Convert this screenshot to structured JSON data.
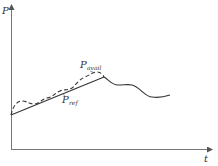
{
  "diagram": {
    "type": "power-time curve",
    "axes": {
      "y_label": "P",
      "x_label": "t"
    },
    "curves": [
      {
        "name": "P_avail",
        "label_main": "P",
        "label_sub": "avail",
        "style": "dashed",
        "description": "available power, fluctuating rise above reference"
      },
      {
        "name": "P_ref",
        "label_main": "P",
        "label_sub": "ref",
        "style": "solid",
        "description": "reference power, linear ramp then fluctuating"
      }
    ],
    "colors": {
      "axis": "#555555",
      "curve": "#333333",
      "background": "#ffffff"
    }
  }
}
